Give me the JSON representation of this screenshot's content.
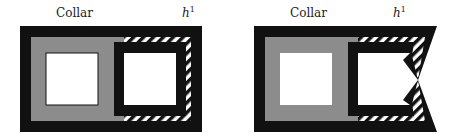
{
  "panels": [
    {
      "label_left": "Collar",
      "label_right_base": "h",
      "label_right_sup": "1"
    },
    {
      "label_left": "Collar",
      "label_right_base": "h",
      "label_right_sup": "1"
    }
  ],
  "colors": {
    "black": "#111111",
    "gray": "#8c8c8c",
    "white": "#ffffff"
  }
}
